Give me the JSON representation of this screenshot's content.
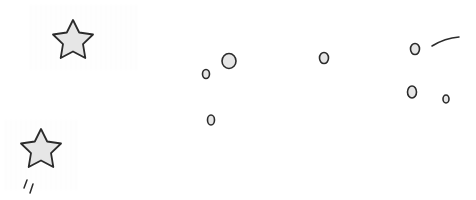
{
  "illustration": {
    "background": "#ffffff",
    "stroke_color": "#2b2b2b",
    "fill_color": "#e6e6e6",
    "stars": [
      {
        "name": "star-top-left",
        "cx": 73,
        "cy": 41,
        "r": 21
      },
      {
        "name": "star-bottom-left",
        "cx": 41,
        "cy": 150,
        "r": 21
      }
    ],
    "circles": [
      {
        "name": "circle-1",
        "cx": 229,
        "cy": 61,
        "rx": 7,
        "ry": 7.5
      },
      {
        "name": "circle-2",
        "cx": 206,
        "cy": 74,
        "rx": 3.5,
        "ry": 4.5
      },
      {
        "name": "circle-3",
        "cx": 211,
        "cy": 120,
        "rx": 3.5,
        "ry": 5
      },
      {
        "name": "circle-4",
        "cx": 324,
        "cy": 58,
        "rx": 4.5,
        "ry": 5.5
      },
      {
        "name": "circle-5",
        "cx": 415,
        "cy": 49,
        "rx": 4.5,
        "ry": 5.5
      },
      {
        "name": "circle-6",
        "cx": 412,
        "cy": 92,
        "rx": 4.5,
        "ry": 6
      },
      {
        "name": "circle-7",
        "cx": 446,
        "cy": 99,
        "rx": 3,
        "ry": 4
      }
    ],
    "streaks": [
      "M27 180 L24 188",
      "M33 184 L30 193"
    ],
    "curve": "M432 46 Q445 38 459 37"
  }
}
